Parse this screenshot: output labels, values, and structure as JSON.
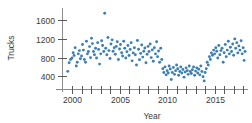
{
  "chart_data": {
    "type": "scatter",
    "title": "",
    "xlabel": "Year",
    "ylabel": "Trucks",
    "xlim": [
      1999.0,
      2018.3
    ],
    "ylim": [
      180,
      1820
    ],
    "grid": false,
    "legend": null,
    "marker_color": "#3d7fb4",
    "axis_color": "#8a8a8a",
    "text_color": "#3a3a3a",
    "xticks": [
      2000,
      2001,
      2002,
      2003,
      2004,
      2005,
      2006,
      2007,
      2008,
      2009,
      2010,
      2011,
      2012,
      2013,
      2014,
      2015,
      2016,
      2017,
      2018
    ],
    "xtick_labels": [
      "2000",
      "",
      "",
      "",
      "",
      "2005",
      "",
      "",
      "",
      "",
      "2010",
      "",
      "",
      "",
      "",
      "2015",
      "",
      "",
      ""
    ],
    "xtick_labels_shown": [
      "2000",
      "2005",
      "2010",
      "2015"
    ],
    "yticks": [
      400,
      800,
      1200,
      1600
    ],
    "ytick_labels": [
      "400",
      "800",
      "1200",
      "1600"
    ],
    "series": [
      {
        "name": "Trucks",
        "points": [
          [
            1999.55,
            505
          ],
          [
            1999.7,
            690
          ],
          [
            1999.85,
            760
          ],
          [
            2000.0,
            790
          ],
          [
            2000.12,
            905
          ],
          [
            2000.22,
            845
          ],
          [
            2000.33,
            1010
          ],
          [
            2000.45,
            620
          ],
          [
            2000.55,
            700
          ],
          [
            2000.66,
            880
          ],
          [
            2000.78,
            950
          ],
          [
            2000.88,
            775
          ],
          [
            2001.0,
            835
          ],
          [
            2001.1,
            1080
          ],
          [
            2001.2,
            960
          ],
          [
            2001.3,
            760
          ],
          [
            2001.42,
            700
          ],
          [
            2001.52,
            1150
          ],
          [
            2001.62,
            880
          ],
          [
            2001.72,
            930
          ],
          [
            2001.84,
            1035
          ],
          [
            2001.95,
            800
          ],
          [
            2002.05,
            1215
          ],
          [
            2002.15,
            1100
          ],
          [
            2002.26,
            930
          ],
          [
            2002.36,
            860
          ],
          [
            2002.48,
            1000
          ],
          [
            2002.58,
            790
          ],
          [
            2002.7,
            1120
          ],
          [
            2002.8,
            975
          ],
          [
            2002.9,
            660
          ],
          [
            2003.02,
            880
          ],
          [
            2003.12,
            1160
          ],
          [
            2003.22,
            1060
          ],
          [
            2003.34,
            930
          ],
          [
            2003.44,
            1750
          ],
          [
            2003.55,
            1000
          ],
          [
            2003.66,
            860
          ],
          [
            2003.78,
            1230
          ],
          [
            2003.88,
            950
          ],
          [
            2004.0,
            780
          ],
          [
            2004.1,
            1090
          ],
          [
            2004.22,
            1180
          ],
          [
            2004.32,
            935
          ],
          [
            2004.44,
            1010
          ],
          [
            2004.55,
            870
          ],
          [
            2004.66,
            1040
          ],
          [
            2004.76,
            1140
          ],
          [
            2004.88,
            760
          ],
          [
            2005.0,
            985
          ],
          [
            2005.1,
            1080
          ],
          [
            2005.22,
            905
          ],
          [
            2005.32,
            835
          ],
          [
            2005.44,
            1150
          ],
          [
            2005.55,
            1000
          ],
          [
            2005.66,
            790
          ],
          [
            2005.78,
            925
          ],
          [
            2005.88,
            1060
          ],
          [
            2006.0,
            845
          ],
          [
            2006.12,
            975
          ],
          [
            2006.22,
            1120
          ],
          [
            2006.32,
            730
          ],
          [
            2006.44,
            900
          ],
          [
            2006.56,
            1010
          ],
          [
            2006.66,
            860
          ],
          [
            2006.78,
            640
          ],
          [
            2006.88,
            1165
          ],
          [
            2007.0,
            980
          ],
          [
            2007.1,
            755
          ],
          [
            2007.22,
            890
          ],
          [
            2007.33,
            1070
          ],
          [
            2007.44,
            810
          ],
          [
            2007.55,
            935
          ],
          [
            2007.66,
            1005
          ],
          [
            2007.78,
            690
          ],
          [
            2007.9,
            870
          ],
          [
            2008.0,
            1040
          ],
          [
            2008.1,
            930
          ],
          [
            2008.22,
            1090
          ],
          [
            2008.33,
            800
          ],
          [
            2008.44,
            965
          ],
          [
            2008.55,
            720
          ],
          [
            2008.66,
            1010
          ],
          [
            2008.78,
            880
          ],
          [
            2008.9,
            1140
          ],
          [
            2009.0,
            820
          ],
          [
            2009.1,
            940
          ],
          [
            2009.22,
            700
          ],
          [
            2009.33,
            1000
          ],
          [
            2009.44,
            760
          ],
          [
            2009.55,
            560
          ],
          [
            2009.66,
            480
          ],
          [
            2009.78,
            600
          ],
          [
            2009.9,
            430
          ],
          [
            2010.0,
            520
          ],
          [
            2010.12,
            470
          ],
          [
            2010.22,
            620
          ],
          [
            2010.33,
            555
          ],
          [
            2010.44,
            330
          ],
          [
            2010.55,
            480
          ],
          [
            2010.66,
            590
          ],
          [
            2010.78,
            440
          ],
          [
            2010.9,
            520
          ],
          [
            2011.0,
            640
          ],
          [
            2011.12,
            560
          ],
          [
            2011.22,
            420
          ],
          [
            2011.33,
            500
          ],
          [
            2011.44,
            600
          ],
          [
            2011.55,
            470
          ],
          [
            2011.66,
            545
          ],
          [
            2011.78,
            380
          ],
          [
            2011.9,
            490
          ],
          [
            2012.0,
            580
          ],
          [
            2012.12,
            520
          ],
          [
            2012.22,
            440
          ],
          [
            2012.33,
            620
          ],
          [
            2012.44,
            500
          ],
          [
            2012.55,
            460
          ],
          [
            2012.66,
            540
          ],
          [
            2012.78,
            600
          ],
          [
            2012.9,
            420
          ],
          [
            2013.0,
            510
          ],
          [
            2013.12,
            580
          ],
          [
            2013.22,
            470
          ],
          [
            2013.33,
            550
          ],
          [
            2013.44,
            430
          ],
          [
            2013.55,
            620
          ],
          [
            2013.66,
            500
          ],
          [
            2013.78,
            390
          ],
          [
            2013.9,
            300
          ],
          [
            2014.0,
            480
          ],
          [
            2014.12,
            560
          ],
          [
            2014.22,
            700
          ],
          [
            2014.33,
            640
          ],
          [
            2014.45,
            820
          ],
          [
            2014.55,
            760
          ],
          [
            2014.66,
            900
          ],
          [
            2014.78,
            850
          ],
          [
            2014.9,
            960
          ],
          [
            2015.0,
            880
          ],
          [
            2015.12,
            1010
          ],
          [
            2015.22,
            935
          ],
          [
            2015.33,
            790
          ],
          [
            2015.44,
            1060
          ],
          [
            2015.55,
            860
          ],
          [
            2015.66,
            950
          ],
          [
            2015.78,
            1000
          ],
          [
            2015.9,
            700
          ],
          [
            2016.0,
            905
          ],
          [
            2016.12,
            1080
          ],
          [
            2016.22,
            820
          ],
          [
            2016.33,
            960
          ],
          [
            2016.44,
            1150
          ],
          [
            2016.55,
            880
          ],
          [
            2016.66,
            1020
          ],
          [
            2016.78,
            930
          ],
          [
            2016.9,
            1090
          ],
          [
            2017.0,
            850
          ],
          [
            2017.12,
            1200
          ],
          [
            2017.22,
            1000
          ],
          [
            2017.33,
            1120
          ],
          [
            2017.44,
            900
          ],
          [
            2017.55,
            1050
          ],
          [
            2017.66,
            960
          ],
          [
            2017.78,
            1160
          ],
          [
            2017.9,
            880
          ],
          [
            2018.0,
            1010
          ],
          [
            2018.1,
            740
          ],
          [
            2018.2,
            930
          ]
        ]
      }
    ]
  }
}
